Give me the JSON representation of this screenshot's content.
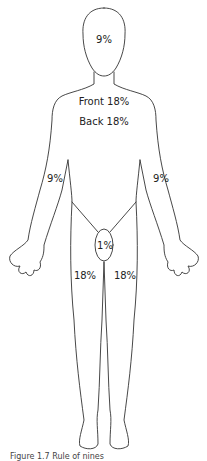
{
  "diagram": {
    "labels": {
      "head": "9%",
      "trunk_front": "Front 18%",
      "trunk_back": "Back 18%",
      "left_arm": "9%",
      "right_arm": "9%",
      "perineum": "1%",
      "left_leg": "18%",
      "right_leg": "18%"
    },
    "caption": "Figure 1.7 Rule of nines"
  },
  "colors": {
    "outline": "#333333",
    "text": "#222222",
    "background": "#ffffff"
  }
}
